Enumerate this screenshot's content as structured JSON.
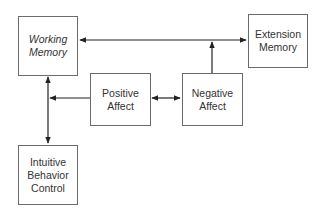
{
  "diagram": {
    "nodes": [
      {
        "id": "working-memory",
        "lines": [
          "Working",
          "Memory"
        ],
        "italic": true
      },
      {
        "id": "extension-memory",
        "lines": [
          "Extension",
          "Memory"
        ],
        "italic": false
      },
      {
        "id": "positive-affect",
        "lines": [
          "Positive",
          "Affect"
        ],
        "italic": false
      },
      {
        "id": "negative-affect",
        "lines": [
          "Negative",
          "Affect"
        ],
        "italic": false
      },
      {
        "id": "intuitive-behavior-control",
        "lines": [
          "Intuitive",
          "Behavior",
          "Control"
        ],
        "italic": false
      }
    ],
    "edges": [
      {
        "from": "working-memory",
        "to": "extension-memory",
        "direction": "bidirectional"
      },
      {
        "from": "negative-affect",
        "to": "working-memory-extension-memory-link",
        "direction": "forward"
      },
      {
        "from": "positive-affect",
        "to": "negative-affect",
        "direction": "bidirectional"
      },
      {
        "from": "positive-affect",
        "to": "working-memory-intuitive-behavior-link",
        "direction": "forward"
      },
      {
        "from": "working-memory",
        "to": "intuitive-behavior-control",
        "direction": "bidirectional"
      }
    ],
    "colors": {
      "line": "#222222",
      "border": "#6a6a6a",
      "text": "#333333"
    }
  }
}
